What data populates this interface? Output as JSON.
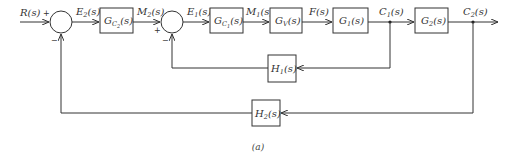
{
  "diagram": {
    "type": "cascade-control-block-diagram",
    "caption": "(a)",
    "signals": {
      "input": {
        "base": "R",
        "sub": "",
        "arg": "(s)"
      },
      "e2": {
        "base": "E",
        "sub": "2",
        "arg": "(s)"
      },
      "m2": {
        "base": "M",
        "sub": "2",
        "arg": "(s)"
      },
      "e1": {
        "base": "E",
        "sub": "1",
        "arg": "(s)"
      },
      "m1": {
        "base": "M",
        "sub": "1",
        "arg": "(s)"
      },
      "f": {
        "base": "F",
        "sub": "",
        "arg": "(s)"
      },
      "c1": {
        "base": "C",
        "sub": "1",
        "arg": "(s)"
      },
      "c2": {
        "base": "C",
        "sub": "2",
        "arg": "(s)"
      }
    },
    "blocks": {
      "gc2": {
        "base": "G",
        "sub": "C",
        "subsub": "2",
        "arg": "(s)"
      },
      "gc1": {
        "base": "G",
        "sub": "C",
        "subsub": "1",
        "arg": "(s)"
      },
      "gv": {
        "base": "G",
        "sub": "V",
        "arg": "(s)"
      },
      "g1": {
        "base": "G",
        "sub": "1",
        "arg": "(s)"
      },
      "g2": {
        "base": "G",
        "sub": "2",
        "arg": "(s)"
      },
      "h1": {
        "base": "H",
        "sub": "1",
        "arg": "(s)"
      },
      "h2": {
        "base": "H",
        "sub": "2",
        "arg": "(s)"
      }
    },
    "summing_junctions": {
      "outer": {
        "plus": "+",
        "minus": "−"
      },
      "inner": {
        "plus": "+",
        "minus": "−"
      }
    },
    "colors": {
      "line": "#333333",
      "text": "#333333",
      "background": "#ffffff"
    }
  }
}
